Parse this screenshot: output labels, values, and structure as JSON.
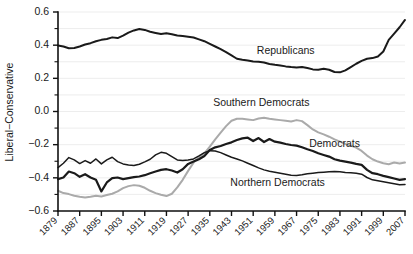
{
  "chart_data": {
    "type": "line",
    "title": "",
    "xlabel": "",
    "ylabel": "Liberal−Conservative",
    "xlim": [
      1879,
      2007
    ],
    "ylim": [
      -0.6,
      0.6
    ],
    "grid": true,
    "legend_position": "inline-annotations",
    "y_ticks": [
      "0.6",
      "0.4",
      "0.2",
      "0.0",
      "−0.2",
      "−0.4",
      "−0.6"
    ],
    "y_tick_values": [
      0.6,
      0.4,
      0.2,
      0.0,
      -0.2,
      -0.4,
      -0.6
    ],
    "y_minor_tick_values": [
      0.5,
      0.3,
      0.1,
      -0.1,
      -0.3,
      -0.5
    ],
    "x_ticks": [
      "1879",
      "1887",
      "1895",
      "1903",
      "1911",
      "1919",
      "1927",
      "1935",
      "1943",
      "1951",
      "1959",
      "1967",
      "1975",
      "1983",
      "1991",
      "1999",
      "2007"
    ],
    "x_tick_values": [
      1879,
      1887,
      1895,
      1903,
      1911,
      1919,
      1927,
      1935,
      1943,
      1951,
      1959,
      1967,
      1975,
      1983,
      1991,
      1999,
      2007
    ],
    "x": [
      1879,
      1881,
      1883,
      1885,
      1887,
      1889,
      1891,
      1893,
      1895,
      1897,
      1899,
      1901,
      1903,
      1905,
      1907,
      1909,
      1911,
      1913,
      1915,
      1917,
      1919,
      1921,
      1923,
      1925,
      1927,
      1929,
      1931,
      1933,
      1935,
      1937,
      1939,
      1941,
      1943,
      1945,
      1947,
      1949,
      1951,
      1953,
      1955,
      1957,
      1959,
      1961,
      1963,
      1965,
      1967,
      1969,
      1971,
      1973,
      1975,
      1977,
      1979,
      1981,
      1983,
      1985,
      1987,
      1989,
      1991,
      1993,
      1995,
      1997,
      1999,
      2001,
      2003,
      2005,
      2007
    ],
    "series": [
      {
        "name": "Republicans",
        "color": "#1a1a1a",
        "stroke_width": 2.0,
        "label_x": 1963,
        "label_y": 0.345,
        "values": [
          0.398,
          0.392,
          0.381,
          0.383,
          0.392,
          0.404,
          0.412,
          0.424,
          0.432,
          0.437,
          0.447,
          0.443,
          0.458,
          0.476,
          0.489,
          0.497,
          0.492,
          0.481,
          0.474,
          0.467,
          0.472,
          0.466,
          0.458,
          0.455,
          0.451,
          0.446,
          0.435,
          0.424,
          0.408,
          0.392,
          0.376,
          0.358,
          0.338,
          0.318,
          0.312,
          0.308,
          0.302,
          0.3,
          0.295,
          0.287,
          0.282,
          0.278,
          0.272,
          0.268,
          0.265,
          0.268,
          0.262,
          0.254,
          0.252,
          0.258,
          0.252,
          0.238,
          0.236,
          0.248,
          0.268,
          0.288,
          0.305,
          0.318,
          0.322,
          0.332,
          0.362,
          0.432,
          0.47,
          0.508,
          0.552
        ]
      },
      {
        "name": "Southern Democrats",
        "color": "#aaaaaa",
        "stroke_width": 2.0,
        "label_x": 1954,
        "label_y": 0.032,
        "values": [
          -0.478,
          -0.492,
          -0.498,
          -0.508,
          -0.514,
          -0.518,
          -0.514,
          -0.508,
          -0.512,
          -0.504,
          -0.496,
          -0.482,
          -0.462,
          -0.45,
          -0.444,
          -0.448,
          -0.46,
          -0.478,
          -0.492,
          -0.502,
          -0.51,
          -0.496,
          -0.458,
          -0.412,
          -0.358,
          -0.308,
          -0.276,
          -0.252,
          -0.212,
          -0.168,
          -0.128,
          -0.088,
          -0.056,
          -0.044,
          -0.044,
          -0.048,
          -0.052,
          -0.042,
          -0.038,
          -0.044,
          -0.048,
          -0.052,
          -0.056,
          -0.06,
          -0.052,
          -0.058,
          -0.082,
          -0.108,
          -0.126,
          -0.138,
          -0.152,
          -0.168,
          -0.182,
          -0.196,
          -0.206,
          -0.218,
          -0.238,
          -0.266,
          -0.288,
          -0.302,
          -0.312,
          -0.318,
          -0.308,
          -0.314,
          -0.308
        ]
      },
      {
        "name": "Democrats",
        "color": "#1a1a1a",
        "stroke_width": 2.2,
        "label_x": 1981,
        "label_y": -0.215,
        "values": [
          -0.408,
          -0.398,
          -0.362,
          -0.372,
          -0.394,
          -0.378,
          -0.398,
          -0.412,
          -0.482,
          -0.428,
          -0.402,
          -0.398,
          -0.408,
          -0.402,
          -0.396,
          -0.392,
          -0.384,
          -0.372,
          -0.362,
          -0.352,
          -0.348,
          -0.356,
          -0.368,
          -0.348,
          -0.316,
          -0.302,
          -0.288,
          -0.268,
          -0.232,
          -0.216,
          -0.208,
          -0.196,
          -0.186,
          -0.172,
          -0.162,
          -0.158,
          -0.178,
          -0.16,
          -0.184,
          -0.166,
          -0.182,
          -0.188,
          -0.196,
          -0.202,
          -0.206,
          -0.216,
          -0.228,
          -0.238,
          -0.252,
          -0.262,
          -0.272,
          -0.288,
          -0.296,
          -0.302,
          -0.308,
          -0.316,
          -0.322,
          -0.352,
          -0.372,
          -0.378,
          -0.388,
          -0.396,
          -0.404,
          -0.412,
          -0.408
        ]
      },
      {
        "name": "Northern Democrats",
        "color": "#1a1a1a",
        "stroke_width": 1.5,
        "label_x": 1960,
        "label_y": -0.452,
        "values": [
          -0.338,
          -0.312,
          -0.278,
          -0.292,
          -0.314,
          -0.296,
          -0.312,
          -0.286,
          -0.316,
          -0.292,
          -0.276,
          -0.302,
          -0.316,
          -0.322,
          -0.326,
          -0.318,
          -0.304,
          -0.288,
          -0.262,
          -0.246,
          -0.252,
          -0.272,
          -0.292,
          -0.296,
          -0.292,
          -0.286,
          -0.268,
          -0.248,
          -0.236,
          -0.238,
          -0.248,
          -0.262,
          -0.276,
          -0.286,
          -0.298,
          -0.312,
          -0.326,
          -0.34,
          -0.352,
          -0.36,
          -0.366,
          -0.372,
          -0.378,
          -0.384,
          -0.386,
          -0.382,
          -0.376,
          -0.372,
          -0.368,
          -0.366,
          -0.364,
          -0.362,
          -0.364,
          -0.368,
          -0.37,
          -0.372,
          -0.378,
          -0.398,
          -0.412,
          -0.418,
          -0.424,
          -0.43,
          -0.436,
          -0.442,
          -0.44
        ]
      }
    ]
  }
}
